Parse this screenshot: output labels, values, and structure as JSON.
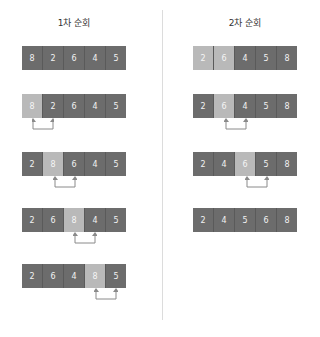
{
  "passes": [
    {
      "title": "1차 순회",
      "steps": [
        {
          "values": [
            "8",
            "2",
            "6",
            "4",
            "5"
          ],
          "highlight": [],
          "swap": null
        },
        {
          "values": [
            "8",
            "2",
            "6",
            "4",
            "5"
          ],
          "highlight": [
            0
          ],
          "swap": [
            0,
            1
          ]
        },
        {
          "values": [
            "2",
            "8",
            "6",
            "4",
            "5"
          ],
          "highlight": [
            1
          ],
          "swap": [
            1,
            2
          ]
        },
        {
          "values": [
            "2",
            "6",
            "8",
            "4",
            "5"
          ],
          "highlight": [
            2
          ],
          "swap": [
            2,
            3
          ]
        },
        {
          "values": [
            "2",
            "6",
            "4",
            "8",
            "5"
          ],
          "highlight": [
            3
          ],
          "swap": [
            3,
            4
          ]
        }
      ]
    },
    {
      "title": "2차 순회",
      "steps": [
        {
          "values": [
            "2",
            "6",
            "4",
            "5",
            "8"
          ],
          "highlight": [
            0,
            1
          ],
          "swap": null
        },
        {
          "values": [
            "2",
            "6",
            "4",
            "5",
            "8"
          ],
          "highlight": [
            1
          ],
          "swap": [
            1,
            2
          ]
        },
        {
          "values": [
            "2",
            "4",
            "6",
            "5",
            "8"
          ],
          "highlight": [
            2
          ],
          "swap": [
            2,
            3
          ]
        },
        {
          "values": [
            "2",
            "4",
            "5",
            "6",
            "8"
          ],
          "highlight": [],
          "swap": null
        }
      ]
    }
  ],
  "colors": {
    "cell": "#6c6c6c",
    "highlight": "#b9b9b9",
    "arrow": "#8a8a8a",
    "divider": "#dcdcdc"
  }
}
